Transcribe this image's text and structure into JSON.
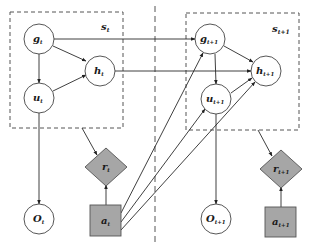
{
  "diagram": {
    "type": "dynamic-bayesian-network",
    "colors": {
      "node_fill": "#ffffff",
      "action_fill": "#a6a6a6",
      "stroke": "#3a3a3a",
      "dashed": "#555555"
    },
    "groups": [
      {
        "id": "s_t",
        "label": "s",
        "sub": "t"
      },
      {
        "id": "s_t1",
        "label": "s",
        "sub": "t+1"
      }
    ],
    "nodes": [
      {
        "id": "g_t",
        "label": "g",
        "sub": "t",
        "shape": "circle"
      },
      {
        "id": "h_t",
        "label": "h",
        "sub": "t",
        "shape": "circle"
      },
      {
        "id": "u_t",
        "label": "u",
        "sub": "t",
        "shape": "circle"
      },
      {
        "id": "O_t",
        "label": "O",
        "sub": "t",
        "shape": "circle"
      },
      {
        "id": "r_t",
        "label": "r",
        "sub": "t",
        "shape": "diamond"
      },
      {
        "id": "a_t",
        "label": "a",
        "sub": "t",
        "shape": "square"
      },
      {
        "id": "g_t1",
        "label": "g",
        "sub": "t+1",
        "shape": "circle"
      },
      {
        "id": "h_t1",
        "label": "h",
        "sub": "t+1",
        "shape": "circle"
      },
      {
        "id": "u_t1",
        "label": "u",
        "sub": "t+1",
        "shape": "circle"
      },
      {
        "id": "O_t1",
        "label": "O",
        "sub": "t+1",
        "shape": "circle"
      },
      {
        "id": "r_t1",
        "label": "r",
        "sub": "t+1",
        "shape": "diamond"
      },
      {
        "id": "a_t1",
        "label": "a",
        "sub": "t+1",
        "shape": "square"
      }
    ],
    "edges": [
      [
        "g_t",
        "h_t"
      ],
      [
        "g_t",
        "u_t"
      ],
      [
        "u_t",
        "h_t"
      ],
      [
        "u_t",
        "O_t"
      ],
      [
        "s_t",
        "r_t"
      ],
      [
        "a_t",
        "r_t"
      ],
      [
        "g_t",
        "g_t1"
      ],
      [
        "h_t",
        "h_t1"
      ],
      [
        "a_t",
        "g_t1"
      ],
      [
        "a_t",
        "u_t1"
      ],
      [
        "a_t",
        "h_t1"
      ],
      [
        "g_t1",
        "h_t1"
      ],
      [
        "g_t1",
        "u_t1"
      ],
      [
        "u_t1",
        "h_t1"
      ],
      [
        "u_t1",
        "O_t1"
      ],
      [
        "s_t1",
        "r_t1"
      ],
      [
        "a_t1",
        "r_t1"
      ]
    ]
  }
}
